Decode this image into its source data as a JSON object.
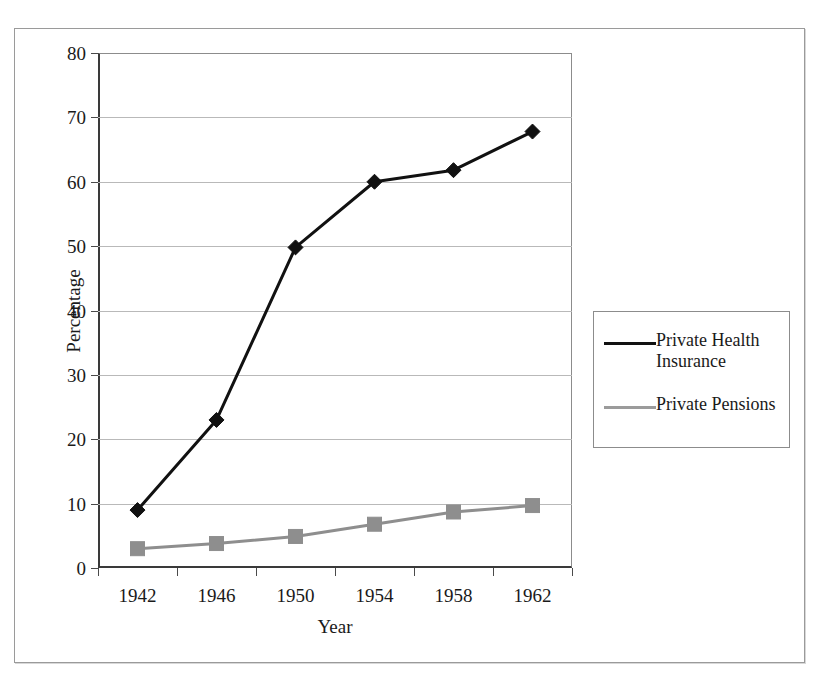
{
  "chart_data": {
    "type": "line",
    "title": "",
    "xlabel": "Year",
    "ylabel": "Percentage",
    "categories": [
      "1942",
      "1946",
      "1950",
      "1954",
      "1958",
      "1962"
    ],
    "x": [
      1942,
      1946,
      1950,
      1954,
      1958,
      1962
    ],
    "series": [
      {
        "name": "Private Health Insurance",
        "values": [
          9.0,
          23.0,
          49.8,
          60.0,
          61.8,
          67.8
        ],
        "color": "#111111",
        "marker": "diamond"
      },
      {
        "name": "Private Pensions",
        "values": [
          3.0,
          3.8,
          4.9,
          6.8,
          8.7,
          9.7
        ],
        "color": "#8e8e8e",
        "marker": "square"
      }
    ],
    "ylim": [
      0,
      80
    ],
    "ytick_labels": [
      "0",
      "10",
      "20",
      "30",
      "40",
      "50",
      "60",
      "70",
      "80"
    ],
    "ytick_values": [
      0,
      10,
      20,
      30,
      40,
      50,
      60,
      70,
      80
    ],
    "grid": "horizontal",
    "legend_position": "right"
  },
  "legend": {
    "entries": [
      {
        "label": "Private Health Insurance"
      },
      {
        "label": "Private Pensions"
      }
    ]
  },
  "axes": {
    "x_title": "Year",
    "y_title": "Percentage"
  }
}
